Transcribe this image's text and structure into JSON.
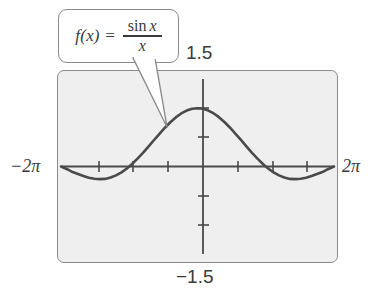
{
  "figure": {
    "name": "graph-of-sin-x-over-x",
    "background_color": "#ffffff",
    "plot_background_color": "#efefef",
    "frame_color": "#8b8b8b",
    "curve_color": "#4a4a4a"
  },
  "callout": {
    "name": "function-label-callout",
    "lhs": "f(x) =",
    "numerator_fn": "sin",
    "numerator_var": "x",
    "denominator": "x",
    "full_text": "f(x) = sin x / x"
  },
  "labels": {
    "x_min": "−2π",
    "x_max": "2π",
    "y_max": "1.5",
    "y_min": "−1.5"
  },
  "chart_data": {
    "type": "line",
    "title": "",
    "xlabel": "",
    "ylabel": "",
    "function": "f(x) = sin(x)/x",
    "xlim": [
      -6.283185307,
      6.283185307
    ],
    "ylim": [
      -1.5,
      1.5
    ],
    "xtick_labels": [
      "−2π",
      "2π"
    ],
    "ytick_labels": [
      "1.5",
      "−1.5"
    ],
    "xticks": [
      -4.71238898,
      -3.141592653,
      -1.570796327,
      1.570796327,
      3.141592653,
      4.71238898
    ],
    "yticks": [
      -1.0,
      -0.5,
      0.5,
      1.0
    ],
    "grid": false,
    "legend": false,
    "series": [
      {
        "name": "sin(x)/x",
        "x": [
          -6.2832,
          -6.0,
          -5.75,
          -5.5,
          -5.25,
          -5.0,
          -4.75,
          -4.5,
          -4.25,
          -4.0,
          -3.75,
          -3.5,
          -3.25,
          -3.1416,
          -3.0,
          -2.75,
          -2.5,
          -2.25,
          -2.0,
          -1.75,
          -1.5,
          -1.25,
          -1.0,
          -0.75,
          -0.5,
          -0.25,
          0.0,
          0.25,
          0.5,
          0.75,
          1.0,
          1.25,
          1.5,
          1.75,
          2.0,
          2.25,
          2.5,
          2.75,
          3.0,
          3.1416,
          3.25,
          3.5,
          3.75,
          4.0,
          4.25,
          4.5,
          4.75,
          5.0,
          5.25,
          5.5,
          5.75,
          6.0,
          6.2832
        ],
        "y": [
          0.0,
          -0.0466,
          -0.0958,
          -0.1283,
          -0.1626,
          -0.1918,
          -0.2095,
          -0.2172,
          -0.2124,
          -0.1892,
          -0.1528,
          -0.1003,
          -0.0336,
          0.0,
          0.047,
          0.14,
          0.2394,
          0.3457,
          0.4546,
          0.5609,
          0.665,
          0.7589,
          0.8415,
          0.9089,
          0.9589,
          0.9896,
          1.0,
          0.9896,
          0.9589,
          0.9089,
          0.8415,
          0.7589,
          0.665,
          0.5609,
          0.4546,
          0.3457,
          0.2394,
          0.14,
          0.047,
          0.0,
          -0.0336,
          -0.1003,
          -0.1528,
          -0.1892,
          -0.2124,
          -0.2172,
          -0.2095,
          -0.1918,
          -0.1626,
          -0.1283,
          -0.0958,
          -0.0466,
          0.0
        ]
      }
    ]
  }
}
